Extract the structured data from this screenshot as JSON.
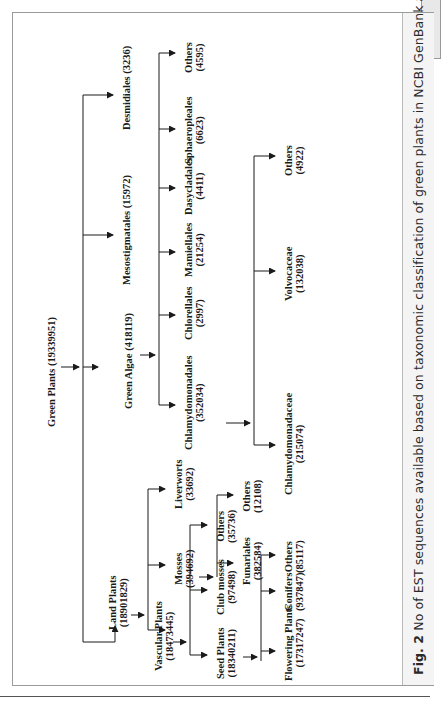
{
  "page": {
    "page_number": ""
  },
  "figure": {
    "label": "Fig. 2",
    "caption": "No of EST sequences available based on taxonomic classification of green plants in NCBI GenBank as of February 2009."
  },
  "tree": {
    "root": {
      "name": "Green Plants",
      "count": "(19339951)"
    },
    "green_algae": {
      "name": "Green Algae",
      "count": "(418119)"
    },
    "algae_children": {
      "chlamydomonadales": {
        "name": "Chlamydomonadales",
        "count": "(352034)"
      },
      "chlorellales": {
        "name": "Chlorellales",
        "count": "(2997)"
      },
      "mamiellales": {
        "name": "Mamiellales",
        "count": "(21254)"
      },
      "dasycladales": {
        "name": "Dasycladales",
        "count": "(4411)"
      },
      "sphaeropleales": {
        "name": "Sphaeropleales",
        "count": "(6623)"
      },
      "others": {
        "name": "Others",
        "count": "(4595)"
      },
      "mesostigmatales": {
        "name": "Mesostigmatales",
        "count": "(15972)"
      },
      "desmidiales": {
        "name": "Desmidiales",
        "count": "(3236)"
      }
    },
    "chlamy_children": {
      "chlamydomonadaceae": {
        "name": "Chlamydomonadaceae",
        "count": "(215074)"
      },
      "volvocaceae": {
        "name": "Volvocaceae",
        "count": "(132038)"
      },
      "others": {
        "name": "Others",
        "count": "(4922)"
      }
    },
    "land_plants": {
      "name": "Land Plants",
      "count": "(18901829)"
    },
    "land_children": {
      "vascular": {
        "name": "Vascular Plants",
        "count": "(18473445)"
      },
      "mosses": {
        "name": "Mosses",
        "count": "(394692)"
      },
      "liverworts": {
        "name": "Liverworts",
        "count": "(33692)"
      }
    },
    "moss_children": {
      "funariales": {
        "name": "Funariales",
        "count": "(382584)"
      },
      "others": {
        "name": "Others",
        "count": "(12108)"
      }
    },
    "vascular_children": {
      "seed": {
        "name": "Seed Plants",
        "count": "(18340211)"
      },
      "club_mosses": {
        "name": "Club mosses",
        "count": "(97498)"
      },
      "others": {
        "name": "Others",
        "count": "(35736)"
      }
    },
    "seed_children": {
      "flowering": {
        "name": "Flowering Plants",
        "count": "(17317247)"
      },
      "conifers": {
        "name": "Conifers",
        "count": "(937847)"
      },
      "others": {
        "name": "Others",
        "count": "(85117)"
      }
    }
  },
  "colors": {
    "line": "#1a1a1a",
    "frame": "#9a9a9a",
    "caption_bg": "#f4f4f4"
  }
}
